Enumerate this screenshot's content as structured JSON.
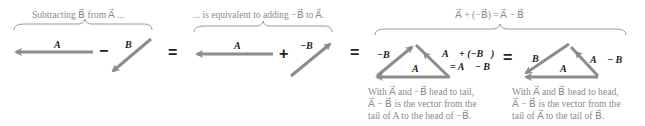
{
  "colors": {
    "arrow": "#8c8c8c",
    "brace": "#9a9a9a",
    "caption_text": "#8a8a8a",
    "label_text": "#222222"
  },
  "captions": {
    "subtracting": "Subtracting B⃗ from A⃗ ...",
    "equivalent": "... is equivalent to adding −B⃗ to A⃗.",
    "identity": "A⃗ + (−B⃗) = A⃗ − B⃗"
  },
  "panels": [
    {
      "id": "subtract",
      "vectors": [
        {
          "label": "A⃗",
          "direction": "left"
        },
        {
          "label": "B⃗",
          "direction": "down-left"
        }
      ],
      "operator": "−"
    },
    {
      "id": "add-negative",
      "vectors": [
        {
          "label": "A⃗",
          "direction": "left"
        },
        {
          "label": "−B⃗",
          "direction": "up-right"
        }
      ],
      "operator": "+"
    },
    {
      "id": "head-to-tail",
      "labels": {
        "negB": "−B⃗",
        "A": "A⃗",
        "sum_line1": "A⃗ + (−B⃗)",
        "sum_line2": "= A⃗ − B⃗"
      },
      "description": [
        "With A⃗ and −B⃗ head to tail,",
        "A⃗ − B⃗ is the vector from the",
        "tail of A to the head of −B⃗."
      ]
    },
    {
      "id": "head-to-head",
      "labels": {
        "B": "B⃗",
        "A": "A⃗",
        "diff": "A⃗ − B⃗"
      },
      "description": [
        "With A⃗ and B⃗ head to head,",
        "A⃗ − B⃗ is the vector from the",
        "tail of A⃗ to the tail of B⃗."
      ]
    }
  ],
  "equals": [
    "=",
    "=",
    "=",
    "="
  ]
}
